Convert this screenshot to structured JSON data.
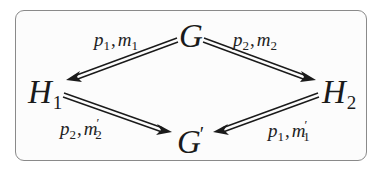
{
  "diagram": {
    "type": "commutative-diagram",
    "colors": {
      "frame_border": "#8a8a8a",
      "arrow": "#1a1a1a",
      "text": "#1a1a1a"
    },
    "nodes": {
      "G": {
        "symbol": "G",
        "subscript": "",
        "prime": ""
      },
      "H1": {
        "symbol": "H",
        "subscript": "1",
        "prime": ""
      },
      "H2": {
        "symbol": "H",
        "subscript": "2",
        "prime": ""
      },
      "Gprime": {
        "symbol": "G",
        "subscript": "",
        "prime": "′"
      }
    },
    "edges": [
      {
        "id": "G-to-H1",
        "from": "G",
        "to": "H1",
        "style": "double-arrow",
        "label": {
          "p": "p",
          "p_sub": "1",
          "comma": ",",
          "m": "m",
          "m_sub": "1",
          "m_prime": ""
        }
      },
      {
        "id": "G-to-H2",
        "from": "G",
        "to": "H2",
        "style": "double-arrow",
        "label": {
          "p": "p",
          "p_sub": "2",
          "comma": ",",
          "m": "m",
          "m_sub": "2",
          "m_prime": ""
        }
      },
      {
        "id": "H1-to-Gprime",
        "from": "H1",
        "to": "Gprime",
        "style": "double-arrow",
        "label": {
          "p": "p",
          "p_sub": "2",
          "comma": ",",
          "m": "m",
          "m_sub": "2",
          "m_prime": "′"
        }
      },
      {
        "id": "H2-to-Gprime",
        "from": "H2",
        "to": "Gprime",
        "style": "double-arrow",
        "label": {
          "p": "p",
          "p_sub": "1",
          "comma": ",",
          "m": "m",
          "m_sub": "1",
          "m_prime": "′"
        }
      }
    ]
  }
}
